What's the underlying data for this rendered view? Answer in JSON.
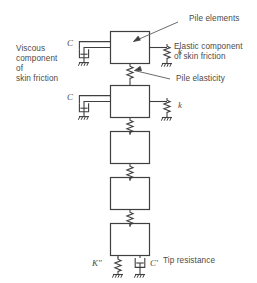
{
  "figure": {
    "type": "engineering-schematic"
  },
  "annotations": {
    "pile_elements": "Pile elements",
    "elastic_component_line1": "Elastic component",
    "elastic_component_line2": "of skin friction",
    "pile_elasticity": "Pile elasticity",
    "viscous_line1": "Viscous",
    "viscous_line2": "component",
    "viscous_line3": "of",
    "viscous_line4": "skin friction",
    "tip_resistance": "Tip resistance"
  },
  "symbols": {
    "dashpot_top": "C",
    "dashpot_second": "C",
    "spring_top": "k",
    "spring_second": "k",
    "tip_spring": "K\"",
    "tip_dashpot": "Cʹ"
  },
  "colors": {
    "stroke": "#3f3f3f",
    "text": "#4a4a4a",
    "background": "#ffffff"
  },
  "elements": {
    "box_count": 5,
    "boxes_with_skin_friction": 2,
    "connector_springs": 4
  }
}
